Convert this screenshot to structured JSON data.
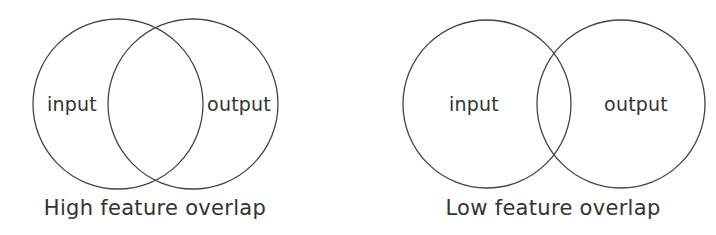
{
  "diagrams": [
    {
      "caption": "High feature overlap",
      "left_label": "input",
      "right_label": "output",
      "left_circle": {
        "cx": 118,
        "cy": 104,
        "r": 85
      },
      "right_circle": {
        "cx": 193,
        "cy": 104,
        "r": 85
      }
    },
    {
      "caption": "Low feature overlap",
      "left_label": "input",
      "right_label": "output",
      "left_circle": {
        "cx": 487,
        "cy": 104,
        "r": 84
      },
      "right_circle": {
        "cx": 621,
        "cy": 104,
        "r": 84
      }
    }
  ],
  "colors": {
    "stroke": "#444444",
    "text": "#333333",
    "background": "#ffffff"
  }
}
